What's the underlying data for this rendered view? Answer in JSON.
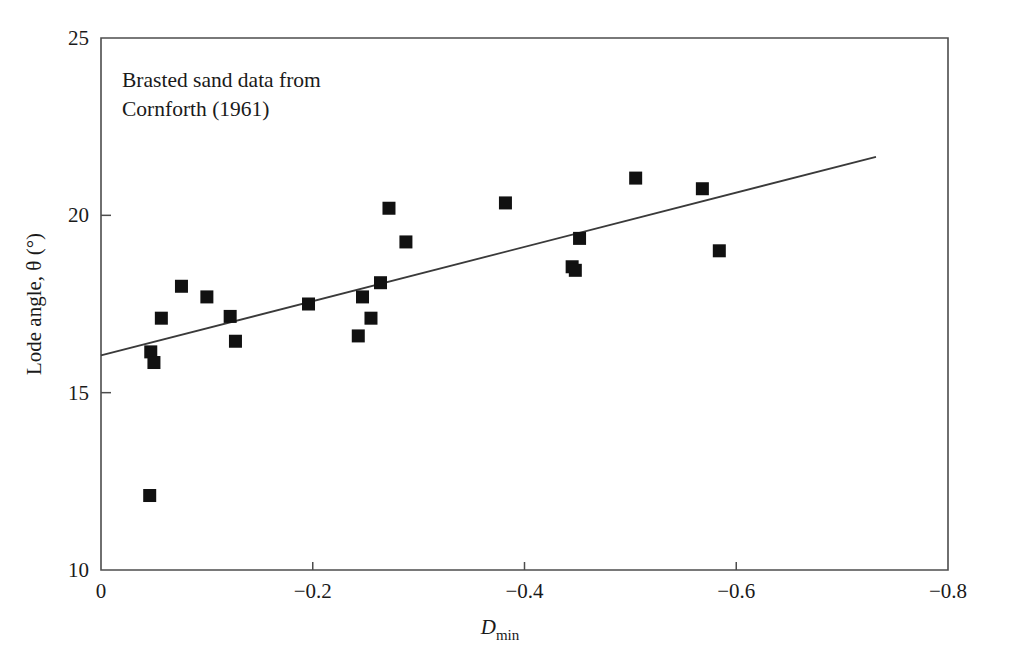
{
  "chart_data": {
    "type": "scatter",
    "title": "",
    "annotation": "Brasted sand data from\nCornforth (1961)",
    "annotation_lines": [
      "Brasted sand data from",
      "Cornforth (1961)"
    ],
    "xlabel": "D_min",
    "xlabel_base": "D",
    "xlabel_sub": "min",
    "ylabel": "Lode angle, θ (°)",
    "xlim": [
      0,
      -0.8
    ],
    "ylim": [
      10,
      25
    ],
    "xticks": [
      0,
      -0.2,
      -0.4,
      -0.6,
      -0.8
    ],
    "xticklabels": [
      "0",
      "−0.2",
      "−0.4",
      "−0.6",
      "−0.8"
    ],
    "yticks": [
      10,
      15,
      20,
      25
    ],
    "yticklabels": [
      "10",
      "15",
      "20",
      "25"
    ],
    "grid": false,
    "legend": false,
    "marker_shape": "filled-square",
    "marker_color": "#111111",
    "series": [
      {
        "name": "Brasted sand data",
        "points": [
          {
            "x": -0.046,
            "y": 12.1
          },
          {
            "x": -0.047,
            "y": 16.15
          },
          {
            "x": -0.05,
            "y": 15.85
          },
          {
            "x": -0.057,
            "y": 17.1
          },
          {
            "x": -0.076,
            "y": 18.0
          },
          {
            "x": -0.1,
            "y": 17.7
          },
          {
            "x": -0.122,
            "y": 17.15
          },
          {
            "x": -0.127,
            "y": 16.45
          },
          {
            "x": -0.196,
            "y": 17.5
          },
          {
            "x": -0.243,
            "y": 16.6
          },
          {
            "x": -0.247,
            "y": 17.7
          },
          {
            "x": -0.255,
            "y": 17.1
          },
          {
            "x": -0.264,
            "y": 18.1
          },
          {
            "x": -0.272,
            "y": 20.2
          },
          {
            "x": -0.288,
            "y": 19.25
          },
          {
            "x": -0.382,
            "y": 20.35
          },
          {
            "x": -0.445,
            "y": 18.55
          },
          {
            "x": -0.448,
            "y": 18.45
          },
          {
            "x": -0.452,
            "y": 19.35
          },
          {
            "x": -0.505,
            "y": 21.05
          },
          {
            "x": -0.568,
            "y": 20.75
          },
          {
            "x": -0.584,
            "y": 19.0
          }
        ]
      }
    ],
    "trend_line": {
      "name": "best-fit line",
      "x_start": 0.0,
      "y_start": 16.05,
      "x_end": -0.732,
      "y_end": 21.65,
      "color": "#3a3a3a"
    }
  }
}
